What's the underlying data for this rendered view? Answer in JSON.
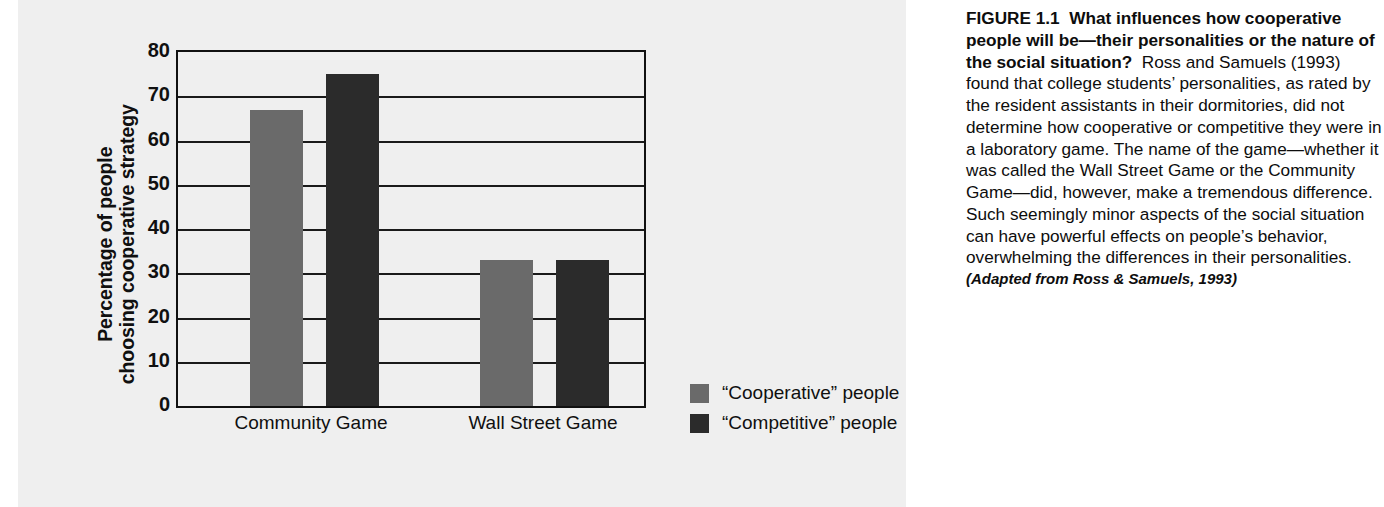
{
  "chart_data": {
    "type": "bar",
    "title": "",
    "xlabel": "",
    "ylabel": "Percentage of people choosing cooperative strategy",
    "ylabel_lines": [
      "Percentage of people",
      "choosing cooperative strategy"
    ],
    "categories": [
      "Community Game",
      "Wall Street Game"
    ],
    "series": [
      {
        "name": "“Cooperative” people",
        "color": "#6a6a6a",
        "values": [
          67,
          33
        ]
      },
      {
        "name": "“Competitive” people",
        "color": "#2b2b2b",
        "values": [
          75,
          33
        ]
      }
    ],
    "ylim": [
      0,
      80
    ],
    "yticks": [
      0,
      10,
      20,
      30,
      40,
      50,
      60,
      70,
      80
    ],
    "ytick_labels": [
      "0",
      "10",
      "20",
      "30",
      "40",
      "50",
      "60",
      "70",
      "80"
    ],
    "grid": true,
    "legend_position": "inside-bottom-right"
  },
  "caption": {
    "figure_label": "FIGURE 1.1",
    "headline": "What influences how cooperative people will be—their personalities or the nature of the social situation?",
    "body": "Ross and Samuels (1993) found that college students’ personalities, as rated by the resident assistants in their dormitories, did not determine how cooperative or competitive they were in a laboratory game. The name of the game—whether it was called the Wall Street Game or the Community Game—did, however, make a tremendous difference. Such seemingly minor aspects of the social situation can have powerful effects on people’s behavior, overwhelming the differences in their personalities.",
    "source": "(Adapted from Ross & Samuels, 1993)"
  },
  "colors": {
    "panel_background": "#efefef",
    "page_background": "#ffffff",
    "axis": "#111111",
    "cooperative_bar": "#6a6a6a",
    "competitive_bar": "#2b2b2b"
  }
}
